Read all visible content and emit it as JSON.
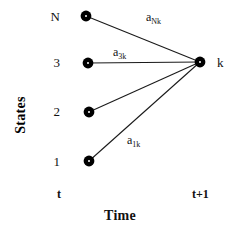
{
  "figure": {
    "type": "trellis-diagram",
    "background_color": "#ffffff",
    "ink_color": "#000000"
  },
  "axes": {
    "y_title": "States",
    "x_title": "Time",
    "x_ticks": [
      {
        "label": "t",
        "x": 57
      },
      {
        "label": "t+1",
        "x": 196
      }
    ]
  },
  "source_nodes": [
    {
      "id": "N",
      "label": "N",
      "x": 86,
      "y": 16
    },
    {
      "id": "3",
      "label": "3",
      "x": 88,
      "y": 63
    },
    {
      "id": "2",
      "label": "2",
      "x": 89,
      "y": 112
    },
    {
      "id": "1",
      "label": "1",
      "x": 89,
      "y": 161
    }
  ],
  "target_node": {
    "id": "k",
    "label": "k",
    "x": 200,
    "y": 62
  },
  "edges": [
    {
      "from": "N",
      "to": "k",
      "label_base": "a",
      "label_sub": "Nk",
      "label_x": 146,
      "label_y": 11
    },
    {
      "from": "3",
      "to": "k",
      "label_base": "a",
      "label_sub": "3k",
      "label_x": 113,
      "label_y": 46
    },
    {
      "from": "2",
      "to": "k",
      "label_base": "a",
      "label_sub": "2k",
      "label_x": null,
      "label_y": null
    },
    {
      "from": "1",
      "to": "k",
      "label_base": "a",
      "label_sub": "1k",
      "label_x": 127,
      "label_y": 134
    }
  ]
}
